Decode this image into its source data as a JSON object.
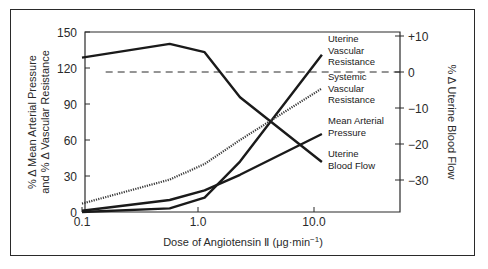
{
  "chart_data": {
    "type": "line",
    "title": "",
    "xlabel": "Dose of Angiotensin II (μg·min⁻¹)",
    "xlabel_parts": {
      "main": "Dose of Angiotensin Ⅱ (μg·min",
      "sup": "−1",
      "close": ")"
    },
    "ylabel_left": [
      "% Δ Mean Arterial Pressure",
      "and % Δ Vascular Resistance"
    ],
    "ylabel_right": "% Δ Uterine Blood Flow",
    "x_scale": "log",
    "x_ticks": [
      {
        "value": 0.1,
        "label": "0.1"
      },
      {
        "value": 1.0,
        "label": "1.0"
      },
      {
        "value": 10.0,
        "label": "10.0"
      }
    ],
    "y_left_ticks": [
      {
        "value": 0,
        "label": "0"
      },
      {
        "value": 30,
        "label": "30"
      },
      {
        "value": 60,
        "label": "60"
      },
      {
        "value": 90,
        "label": "90"
      },
      {
        "value": 120,
        "label": "120"
      },
      {
        "value": 150,
        "label": "150"
      }
    ],
    "y_right_ticks": [
      {
        "value": 10,
        "label": "+10"
      },
      {
        "value": 0,
        "label": "0"
      },
      {
        "value": -10,
        "label": "−10"
      },
      {
        "value": -20,
        "label": "−20"
      },
      {
        "value": -30,
        "label": "−30"
      }
    ],
    "ylim_left": [
      0,
      150
    ],
    "ylim_right": [
      -39,
      10
    ],
    "xlim": [
      0.1,
      20
    ],
    "grid": false,
    "reference_line": {
      "axis": "right",
      "value": 0,
      "style": "dashed",
      "x_start": 0.16
    },
    "x": [
      0.1,
      0.57,
      1.14,
      2.3,
      11.7
    ],
    "series": [
      {
        "name": "Uterine Vascular Resistance",
        "axis": "left",
        "style": "solid-thick",
        "label_lines": [
          "Uterine",
          "Vascular",
          "Resistance"
        ],
        "values": [
          0,
          3,
          12,
          42,
          131
        ]
      },
      {
        "name": "Systemic Vascular Resistance",
        "axis": "left",
        "style": "dotted",
        "label_lines": [
          "Systemic",
          "Vascular",
          "Resistance"
        ],
        "values": [
          7,
          27,
          40,
          60,
          103
        ]
      },
      {
        "name": "Mean Arterial Pressure",
        "axis": "left",
        "style": "solid-thick",
        "label_lines": [
          "Mean Arterial",
          "Pressure"
        ],
        "values": [
          1,
          10,
          18,
          31,
          65
        ]
      },
      {
        "name": "Uterine Blood Flow",
        "axis": "right",
        "style": "solid-thick",
        "label_lines": [
          "Uterine",
          "Blood Flow"
        ],
        "values": [
          4,
          7.8,
          5.5,
          -7,
          -25
        ]
      }
    ]
  },
  "colors": {
    "ink": "#1a1a1a",
    "axis": "#2a2a2a",
    "background": "#ffffff"
  }
}
